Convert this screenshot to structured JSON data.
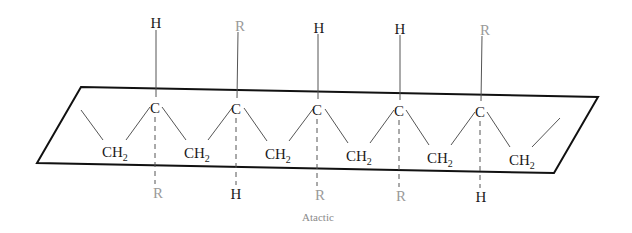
{
  "diagram": {
    "caption": "Atactic",
    "colors": {
      "ink": "#1a1a1a",
      "faded": "#9a9a9a",
      "plane": "#111111",
      "bond": "#555555",
      "caption": "#8a8a8a"
    },
    "backbone_carbon_label": "C",
    "methylene_label": "CH",
    "methylene_subscript": "2",
    "carbons": [
      {
        "index": 1,
        "label": "C",
        "up": "H",
        "down": "R"
      },
      {
        "index": 2,
        "label": "C",
        "up": "R",
        "down": "H"
      },
      {
        "index": 3,
        "label": "C",
        "up": "H",
        "down": "R"
      },
      {
        "index": 4,
        "label": "C",
        "up": "H",
        "down": "R"
      },
      {
        "index": 5,
        "label": "C",
        "up": "R",
        "down": "H"
      }
    ],
    "methylenes": [
      "CH2",
      "CH2",
      "CH2",
      "CH2",
      "CH2",
      "CH2"
    ]
  }
}
